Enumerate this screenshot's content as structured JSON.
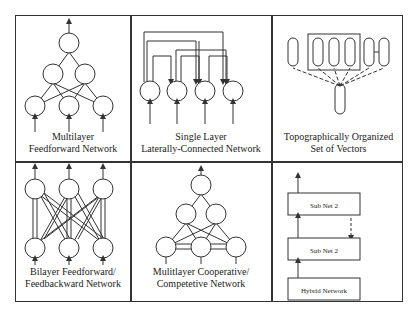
{
  "figure": {
    "panels": [
      {
        "id": "multilayer-feedforward",
        "caption_lines": [
          "Multilayer",
          "Feedforward Network"
        ]
      },
      {
        "id": "single-layer-lateral",
        "caption_lines": [
          "Single Layer",
          "Laterally-Connected Network"
        ]
      },
      {
        "id": "topographic-vectors",
        "caption_lines": [
          "Topographically Organized",
          "Set of Vectors"
        ]
      },
      {
        "id": "bilayer-feedback",
        "caption_lines": [
          "Bilayer Feedforward/",
          "Feedbackward Network"
        ]
      },
      {
        "id": "multilayer-cooperative",
        "caption_lines": [
          "Mulitlayer Cooperative/",
          "Competetive Network"
        ]
      },
      {
        "id": "hybrid-network",
        "caption_lines": [],
        "boxes": [
          "Sub Net 2",
          "Sub Net 2",
          "Hybrid Network"
        ]
      }
    ]
  },
  "colors": {
    "line": "#333333",
    "background": "#ffffff"
  }
}
